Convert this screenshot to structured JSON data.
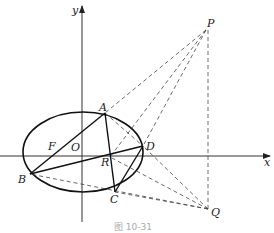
{
  "figure": {
    "caption": "图 10-31",
    "axes": {
      "x_label": "x",
      "y_label": "y",
      "origin_label": "O"
    },
    "points": {
      "P": {
        "label": "P",
        "x": 206,
        "y": 30
      },
      "Q": {
        "label": "Q",
        "x": 208,
        "y": 209
      },
      "A": {
        "label": "A",
        "x": 105,
        "y": 113
      },
      "B": {
        "label": "B",
        "x": 30,
        "y": 174
      },
      "C": {
        "label": "C",
        "x": 115,
        "y": 192
      },
      "D": {
        "label": "D",
        "x": 143,
        "y": 146
      },
      "R": {
        "label": "R",
        "x": 110,
        "y": 157
      },
      "F": {
        "label": "F",
        "x": 55,
        "y": 151
      }
    },
    "ellipse": {
      "cx": 83,
      "cy": 152,
      "rx": 60,
      "ry": 40
    },
    "solid_segments": [
      "A-B",
      "A-C",
      "B-D",
      "C-D"
    ],
    "dashed_segments": [
      "P-A",
      "P-R",
      "P-D",
      "P-Q",
      "Q-B",
      "Q-C",
      "Q-R",
      "Q-D"
    ]
  }
}
